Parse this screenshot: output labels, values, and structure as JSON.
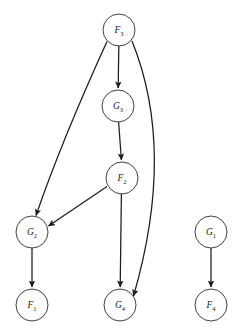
{
  "diagram": {
    "type": "directed-graph",
    "title": "",
    "background_color": "#ffffff",
    "node_fill_color": "#ffffff",
    "node_stroke_color": "#2b2b2b",
    "edge_color": "#1c1c1c",
    "label_color": "#1c1c1c",
    "node_radius": 16,
    "nodes": [
      {
        "id": "F3",
        "base": "F",
        "sub": "3",
        "label": "F3",
        "cx": 119,
        "cy": 30
      },
      {
        "id": "G3",
        "base": "G",
        "sub": "3",
        "label": "G3",
        "cx": 118,
        "cy": 106
      },
      {
        "id": "F2",
        "base": "F",
        "sub": "2",
        "label": "F2",
        "cx": 122,
        "cy": 178
      },
      {
        "id": "G2",
        "base": "G",
        "sub": "2",
        "label": "G2",
        "cx": 32,
        "cy": 232
      },
      {
        "id": "F1",
        "base": "F",
        "sub": "1",
        "label": "F1",
        "cx": 32,
        "cy": 305
      },
      {
        "id": "G4",
        "base": "G",
        "sub": "4",
        "label": "G4",
        "cx": 120,
        "cy": 305
      },
      {
        "id": "G1",
        "base": "G",
        "sub": "1",
        "label": "G1",
        "cx": 211,
        "cy": 232
      },
      {
        "id": "F4",
        "base": "F",
        "sub": "4",
        "label": "F4",
        "cx": 211,
        "cy": 305
      }
    ],
    "edges": [
      {
        "from": "F3",
        "to": "G3",
        "shape": "straight",
        "path": "M 118.8 46.0 L 118.2 88.0"
      },
      {
        "from": "F3",
        "to": "G2",
        "shape": "curved",
        "path": "M 107.0 41.5 Q 62.0 140.0 36.0 215.5"
      },
      {
        "from": "F3",
        "to": "G4",
        "shape": "curved",
        "path": "M 132.0 41.0 Q 176.0 150.0 133.5 296.0"
      },
      {
        "from": "G3",
        "to": "F2",
        "shape": "straight",
        "path": "M 118.6 122.0 L 121.4 160.0"
      },
      {
        "from": "F2",
        "to": "G2",
        "shape": "straight",
        "path": "M 107.0 186.5 L 48.5 226.0"
      },
      {
        "from": "F2",
        "to": "G4",
        "shape": "straight",
        "path": "M 121.4 194.0 L 120.2 287.0"
      },
      {
        "from": "G2",
        "to": "F1",
        "shape": "straight",
        "path": "M 32.0 248.0 L 32.0 287.0"
      },
      {
        "from": "G1",
        "to": "F4",
        "shape": "straight",
        "path": "M 211.0 248.0 L 211.0 287.0"
      }
    ]
  }
}
